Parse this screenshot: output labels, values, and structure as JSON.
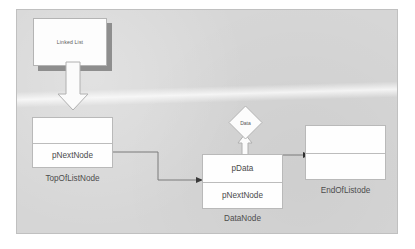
{
  "diagram": {
    "title_box": {
      "label": "Linked List"
    },
    "nodes": [
      {
        "id": "top-of-list-node",
        "caption": "TopOfListNode",
        "cells": [
          {
            "label": ""
          },
          {
            "label": "pNextNode"
          }
        ]
      },
      {
        "id": "data-node",
        "caption": "DataNode",
        "cells": [
          {
            "label": "pData"
          },
          {
            "label": "pNextNode"
          }
        ]
      },
      {
        "id": "end-of-list-node",
        "caption": "EndOfListode",
        "cells": [
          {
            "label": ""
          },
          {
            "label": ""
          }
        ]
      }
    ],
    "diamond": {
      "label": "Data"
    },
    "colors": {
      "background": "#d6d6d6",
      "frame_border": "#c0c0c0",
      "box_fill": "#fefefe",
      "box_border": "#b9b9b9",
      "shadow": "#8e8e8e",
      "connector": "#6f6f6f",
      "text": "#4d4d4d"
    }
  }
}
